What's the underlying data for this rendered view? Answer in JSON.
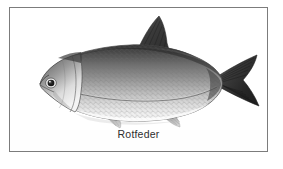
{
  "figure": {
    "caption": "Rotfeder",
    "medium": "grayscale pencil illustration",
    "frame": {
      "border_color": "#7c7c7c",
      "background_color": "#fefefe",
      "page_background": "#ffffff"
    },
    "palette": {
      "dorsal_dark": "#3a3a3a",
      "body_mid": "#8d8d8d",
      "belly_light": "#efefef",
      "fin_dark": "#2b2b2b",
      "fin_light": "#b9b9b9",
      "outline": "#4a4a4a",
      "eye": "#1c1c1c",
      "caption_color": "#2e2e2e"
    },
    "anatomy": [
      "snout",
      "eye",
      "operculum",
      "dorsal-fin",
      "pectoral-fin",
      "pelvic-fin",
      "anal-fin",
      "caudal-fin",
      "lateral-line",
      "scales"
    ]
  }
}
